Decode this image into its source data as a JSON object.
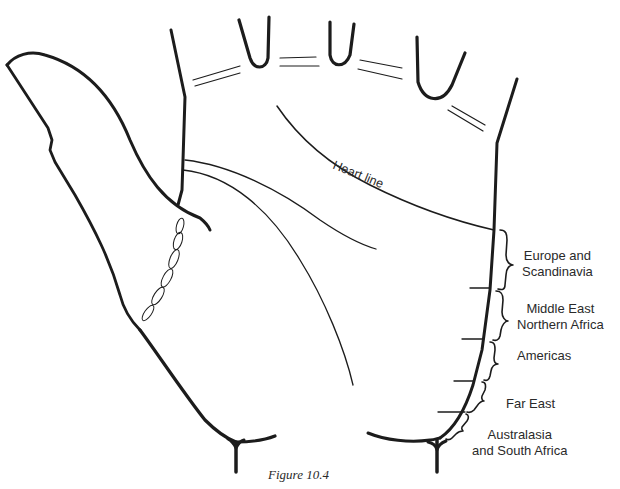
{
  "figure": {
    "caption": "Figure 10.4",
    "heart_line_label": "Heart line",
    "regions": [
      {
        "line1": "Europe and",
        "line2": "Scandinavia"
      },
      {
        "line1": "Middle East",
        "line2": "Northern Africa"
      },
      {
        "line1": "Americas",
        "line2": ""
      },
      {
        "line1": "Far East",
        "line2": ""
      },
      {
        "line1": "Australasia",
        "line2": "and South Africa"
      }
    ]
  },
  "colors": {
    "ink": "#1c1c1c",
    "background": "#ffffff"
  }
}
